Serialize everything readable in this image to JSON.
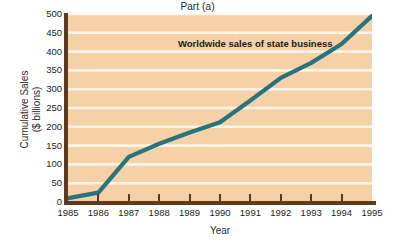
{
  "chart_data": {
    "type": "line",
    "title": "Part (a)",
    "xlabel": "Year",
    "ylabel_line1": "Cumulative Sales",
    "ylabel_line2": "($ billions)",
    "annotation": "Worldwide sales of state business",
    "categories": [
      "1985",
      "1986",
      "1987",
      "1988",
      "1989",
      "1990",
      "1991",
      "1992",
      "1993",
      "1994",
      "1995"
    ],
    "x": [
      1985,
      1986,
      1987,
      1988,
      1989,
      1990,
      1991,
      1992,
      1993,
      1994,
      1995
    ],
    "values": [
      10,
      25,
      120,
      155,
      185,
      212,
      270,
      330,
      370,
      420,
      495
    ],
    "y_ticks": [
      "0",
      "50",
      "100",
      "150",
      "200",
      "250",
      "300",
      "350",
      "400",
      "450",
      "500"
    ],
    "y_tick_values": [
      0,
      50,
      100,
      150,
      200,
      250,
      300,
      350,
      400,
      450,
      500
    ],
    "ylim": [
      0,
      500
    ],
    "xlim": [
      1985,
      1995
    ],
    "grid": "horizontal",
    "legend": "none",
    "series_name": "Worldwide sales of state business",
    "colors": {
      "line": "#26757e",
      "plot_background": "#f6d1a8",
      "gridline": "#fdf3e6",
      "axis": "#5d3a1c",
      "page_background": "#ffffff",
      "text": "#1d1d1d"
    }
  }
}
